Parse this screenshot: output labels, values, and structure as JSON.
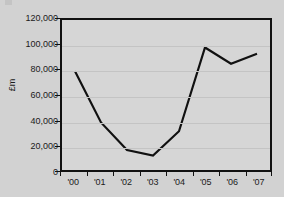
{
  "chart_data": {
    "type": "line",
    "title": "",
    "subtitle": "",
    "xlabel": "",
    "ylabel": "£m",
    "categories": [
      "'00",
      "'01",
      "'02",
      "'03",
      "'04",
      "'05",
      "'06",
      "'07"
    ],
    "values": [
      79000,
      38000,
      16000,
      11500,
      31000,
      98000,
      85000,
      93000
    ],
    "series": [
      {
        "name": "",
        "values": [
          79000,
          38000,
          16000,
          11500,
          31000,
          98000,
          85000,
          93000
        ]
      }
    ],
    "ylim": [
      0,
      120000
    ],
    "ytick_values": [
      0,
      20000,
      40000,
      60000,
      80000,
      100000,
      120000
    ],
    "ytick_labels": [
      "0",
      "20,000",
      "40,000",
      "60,000",
      "80,000",
      "100,000",
      "120,000"
    ],
    "xtick_labels": [
      "'00",
      "'01",
      "'02",
      "'03",
      "'04",
      "'05",
      "'06",
      "'07"
    ],
    "grid": true,
    "grid_axis": "y",
    "legend": false,
    "legend_position": "none",
    "line_color": "#111111",
    "line_width": 2.2,
    "markers": false,
    "plot_background": "#d6d6d6",
    "figure_background": "#d2d2d2",
    "axis_color": "#111111",
    "grid_color": "#c4c4c4",
    "text_color": "#1a1a1a"
  }
}
